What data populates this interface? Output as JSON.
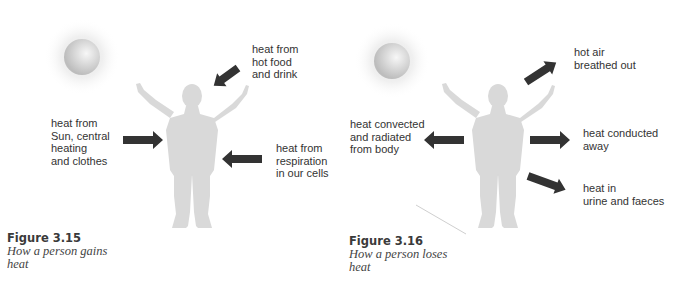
{
  "colors": {
    "figure_fill": "#d9d9d9",
    "arrow_fill": "#333333",
    "text": "#333333",
    "sun": "#cfcfcf"
  },
  "figures": [
    {
      "number": "Figure 3.15",
      "caption": "How a person gains heat",
      "labels": {
        "food": "heat from\nhot food\nand drink",
        "sun": "heat from\nSun, central\nheating\nand clothes",
        "respiration": "heat from\nrespiration\nin our cells"
      },
      "arrows": [
        {
          "name": "food",
          "direction": "in",
          "angle": "down-left"
        },
        {
          "name": "sun",
          "direction": "in",
          "angle": "right"
        },
        {
          "name": "respiration",
          "direction": "in",
          "angle": "left"
        }
      ]
    },
    {
      "number": "Figure 3.16",
      "caption": "How a person loses heat",
      "labels": {
        "breath": "hot air\nbreathed out",
        "convection": "heat convected\nand radiated\nfrom body",
        "conduction": "heat conducted\naway",
        "excretion": "heat in\nurine and faeces"
      },
      "arrows": [
        {
          "name": "breath",
          "direction": "out",
          "angle": "up-right"
        },
        {
          "name": "convection",
          "direction": "out",
          "angle": "left"
        },
        {
          "name": "conduction",
          "direction": "out",
          "angle": "right"
        },
        {
          "name": "excretion",
          "direction": "out",
          "angle": "down-right"
        }
      ]
    }
  ]
}
